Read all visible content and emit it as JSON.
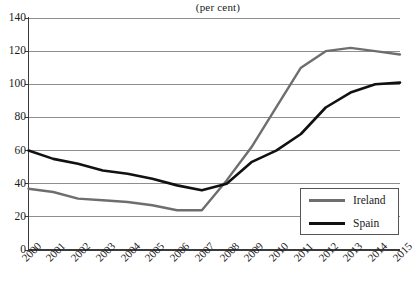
{
  "chart_data": {
    "type": "line",
    "title": "(per cent)",
    "xlabel": "",
    "ylabel": "",
    "ylim": [
      0,
      140
    ],
    "yticks": [
      0,
      20,
      40,
      60,
      80,
      100,
      120,
      140
    ],
    "grid": true,
    "legend_position": "bottom-right",
    "categories": [
      "2000",
      "2001",
      "2002",
      "2003",
      "2004",
      "2005",
      "2006",
      "2007",
      "2008",
      "2009",
      "2010",
      "2011",
      "2012",
      "2013",
      "2014",
      "2015"
    ],
    "series": [
      {
        "name": "Ireland",
        "color": "#6e6e6e",
        "values": [
          37,
          35,
          31,
          30,
          29,
          27,
          24,
          24,
          42,
          62,
          86,
          110,
          120,
          122,
          120,
          118
        ]
      },
      {
        "name": "Spain",
        "color": "#111111",
        "values": [
          60,
          55,
          52,
          48,
          46,
          43,
          39,
          36,
          40,
          53,
          60,
          70,
          86,
          95,
          100,
          101
        ]
      }
    ]
  },
  "axis": {
    "y_tick_labels": [
      "140",
      "120",
      "100",
      "80",
      "60",
      "40",
      "20",
      "0"
    ],
    "x_tick_labels": [
      "2000",
      "2001",
      "2002",
      "2003",
      "2004",
      "2005",
      "2006",
      "2007",
      "2008",
      "2009",
      "2010",
      "2011",
      "2012",
      "2013",
      "2014",
      "2015"
    ]
  },
  "legend": {
    "items": [
      {
        "label": "Ireland",
        "color": "#6e6e6e"
      },
      {
        "label": "Spain",
        "color": "#111111"
      }
    ]
  },
  "colors": {
    "ireland": "#6e6e6e",
    "spain": "#111111",
    "gridline": "#8e8e8e",
    "axis": "#3a3a3a",
    "text": "#1a1a1a",
    "background": "#ffffff"
  }
}
